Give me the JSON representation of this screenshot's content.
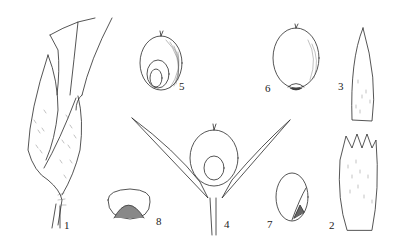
{
  "plate": {
    "background": "#ffffff",
    "ink": "#2a2a2a",
    "figures": [
      {
        "id": "1",
        "label": "1",
        "subject": "spikelet"
      },
      {
        "id": "2",
        "label": "2",
        "subject": "lemma"
      },
      {
        "id": "3",
        "label": "3",
        "subject": "glume"
      },
      {
        "id": "4",
        "label": "4",
        "subject": "spikelet-open-with-caryopsis"
      },
      {
        "id": "5",
        "label": "5",
        "subject": "caryopsis-embryo-side"
      },
      {
        "id": "6",
        "label": "6",
        "subject": "caryopsis-hilum-side"
      },
      {
        "id": "7",
        "label": "7",
        "subject": "palea"
      },
      {
        "id": "8",
        "label": "8",
        "subject": "caryopsis-cross-section"
      }
    ]
  }
}
